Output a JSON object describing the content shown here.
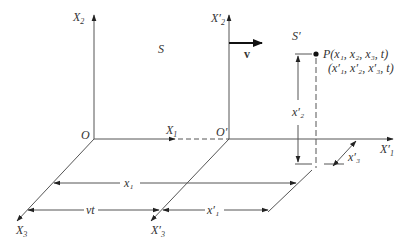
{
  "diagram": {
    "frames": {
      "S": {
        "label": "S",
        "origin_label": "O",
        "axes": {
          "x1": "X",
          "x1_sub": "1",
          "x2": "X",
          "x2_sub": "2",
          "x3": "X",
          "x3_sub": "3"
        }
      },
      "S_prime": {
        "label": "S′",
        "origin_label": "O′",
        "axes": {
          "x1": "X′",
          "x1_sub": "1",
          "x2": "X′",
          "x2_sub": "2",
          "x3": "X′",
          "x3_sub": "3"
        }
      }
    },
    "velocity": {
      "label": "v"
    },
    "point": {
      "line1": "P(x₁, x₂, x₃, t)",
      "line2": "(x′₁, x′₂, x′₃, t)"
    },
    "dimensions": {
      "x1": "x₁",
      "vt": "vt",
      "x1_prime": "x′₁",
      "x2_prime": "x′₂",
      "x3_prime": "x′₃"
    },
    "colors": {
      "line": "#555555",
      "text": "#333333",
      "background": "#ffffff"
    }
  }
}
